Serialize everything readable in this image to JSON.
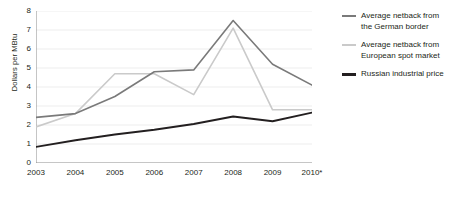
{
  "chart_data": {
    "type": "line",
    "title": "",
    "xlabel": "",
    "ylabel": "Dollars per MBtu",
    "categories": [
      "2003",
      "2004",
      "2005",
      "2006",
      "2007",
      "2008",
      "2009",
      "2010*"
    ],
    "x_tick_labels": [
      "2003",
      "2004",
      "2005",
      "2006",
      "2007",
      "2008",
      "2009",
      "2010*"
    ],
    "y_tick_labels": [
      "0",
      "1",
      "2",
      "3",
      "4",
      "5",
      "6",
      "7",
      "8"
    ],
    "ylim": [
      0,
      8
    ],
    "grid": true,
    "legend_position": "right",
    "series": [
      {
        "name": "Average netback from the German border",
        "color": "#7a7a7a",
        "width": 1.6,
        "values": [
          2.4,
          2.6,
          3.5,
          4.8,
          4.9,
          7.5,
          5.2,
          4.1
        ]
      },
      {
        "name": "Average netback from European spot market",
        "color": "#cacaca",
        "width": 1.6,
        "values": [
          1.9,
          2.6,
          4.7,
          4.7,
          3.6,
          7.1,
          2.8,
          2.8
        ]
      },
      {
        "name": "Russian industrial price",
        "color": "#231f20",
        "width": 1.9,
        "values": [
          0.85,
          1.2,
          1.5,
          1.75,
          2.05,
          2.45,
          2.2,
          2.65
        ]
      }
    ]
  },
  "legend": {
    "items": [
      {
        "label_line1": "Average netback from",
        "label_line2": "the German border"
      },
      {
        "label_line1": "Average netback from",
        "label_line2": "European spot market"
      },
      {
        "label_line1": "Russian industrial price",
        "label_line2": ""
      }
    ]
  },
  "axis": {
    "y_title": "Dollars per MBtu",
    "axis_color": "#8c8c8c",
    "grid_color": "#ededed"
  }
}
